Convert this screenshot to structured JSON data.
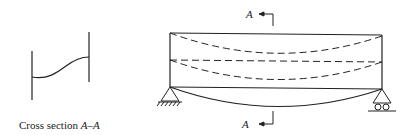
{
  "diagram": {
    "type": "beam-deflection-figure",
    "cross_section": {
      "caption": "Cross section A–A",
      "caption_prefix": "Cross section ",
      "caption_section": "A–A"
    },
    "beam": {
      "section_marker_top": "A",
      "section_marker_bottom": "A",
      "supports": {
        "left": "pin-support",
        "right": "roller-support"
      },
      "lines": [
        {
          "name": "top-flange",
          "style": "solid"
        },
        {
          "name": "top-flange-deflected",
          "style": "dashed"
        },
        {
          "name": "neutral-axis",
          "style": "dashed"
        },
        {
          "name": "bottom-flange-deflected",
          "style": "dashed"
        },
        {
          "name": "bottom-flange",
          "style": "solid"
        },
        {
          "name": "deflected-shape",
          "style": "solid-curve"
        }
      ]
    },
    "colors": {
      "stroke": "#222222",
      "background": "#ffffff"
    }
  }
}
